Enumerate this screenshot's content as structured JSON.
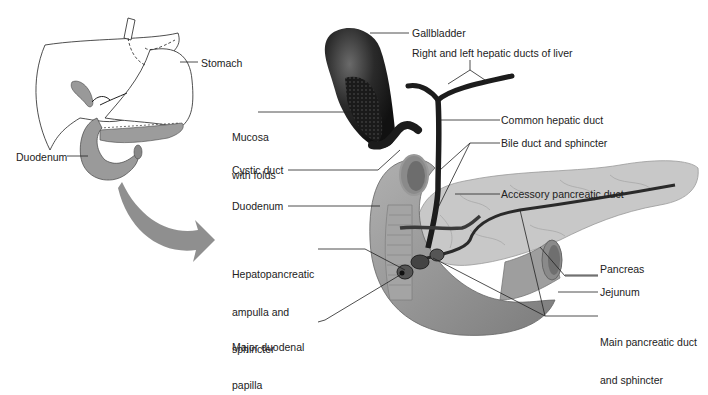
{
  "figure": {
    "inset": {
      "labels": {
        "stomach": "Stomach",
        "duodenum": "Duodenum"
      }
    },
    "main": {
      "labels": {
        "gallbladder": "Gallbladder",
        "hepatic_ducts": "Right and left hepatic ducts of liver",
        "common_hepatic": "Common hepatic duct",
        "bile_duct": "Bile duct and sphincter",
        "accessory_duct": "Accessory pancreatic duct",
        "pancreas": "Pancreas",
        "jejunum": "Jejunum",
        "main_duct_1": "Main pancreatic duct",
        "main_duct_2": "and sphincter",
        "mucosa_1": "Mucosa",
        "mucosa_2": "with folds",
        "cystic_duct": "Cystic duct",
        "duodenum": "Duodenum",
        "ampulla_1": "Hepatopancreatic",
        "ampulla_2": "ampulla and",
        "ampulla_3": "sphincter",
        "papilla_1": "Major duodenal",
        "papilla_2": "papilla"
      }
    },
    "colors": {
      "organ_gray": "#9a9a9a",
      "pancreas_gray": "#c4c4c4",
      "duct_dark": "#1c1c1c",
      "arrow_gray": "#8f8f8f"
    }
  }
}
